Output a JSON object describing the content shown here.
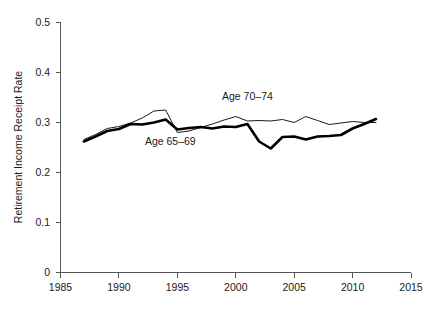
{
  "chart_data": {
    "type": "line",
    "title": "",
    "xlabel": "",
    "ylabel": "Retirement Income Receipt Rate",
    "xlim": [
      1985,
      2015
    ],
    "ylim": [
      0,
      0.5
    ],
    "xticks": [
      1985,
      1990,
      1995,
      2000,
      2005,
      2010,
      2015
    ],
    "xtick_labels": [
      "1985",
      "1990",
      "1995",
      "2000",
      "2005",
      "2010",
      "2015"
    ],
    "yticks": [
      0,
      0.1,
      0.2,
      0.3,
      0.4,
      0.5
    ],
    "ytick_labels": [
      "0",
      "0.1",
      "0.2",
      "0.3",
      "0.4",
      "0.5"
    ],
    "grid": false,
    "legend_position": "inline-annotation",
    "x": [
      1987,
      1988,
      1989,
      1990,
      1991,
      1992,
      1993,
      1994,
      1995,
      1996,
      1997,
      1998,
      1999,
      2000,
      2001,
      2002,
      2003,
      2004,
      2005,
      2006,
      2007,
      2008,
      2009,
      2010,
      2011,
      2012
    ],
    "series": [
      {
        "name": "Age 65-69",
        "label": "Age 65–69",
        "color": "#000000",
        "linewidth": 2.6,
        "values": [
          0.262,
          0.272,
          0.283,
          0.287,
          0.297,
          0.296,
          0.3,
          0.306,
          0.286,
          0.289,
          0.291,
          0.288,
          0.292,
          0.291,
          0.297,
          0.262,
          0.248,
          0.271,
          0.272,
          0.266,
          0.272,
          0.273,
          0.275,
          0.288,
          0.297,
          0.307
        ]
      },
      {
        "name": "Age 70-74",
        "label": "Age 70–74",
        "color": "#000000",
        "linewidth": 0.9,
        "values": [
          0.266,
          0.276,
          0.288,
          0.292,
          0.299,
          0.309,
          0.323,
          0.325,
          0.28,
          0.283,
          0.29,
          0.297,
          0.305,
          0.312,
          0.303,
          0.304,
          0.303,
          0.306,
          0.3,
          0.312,
          0.304,
          0.296,
          0.299,
          0.302,
          0.3,
          0.3
        ]
      }
    ],
    "annotations": [
      {
        "text": "Age 70–74",
        "x": 2001.0,
        "y": 0.345,
        "name": "label-age-70-74"
      },
      {
        "text": "Age 65–69",
        "x": 1994.4,
        "y": 0.255,
        "name": "label-age-65-69"
      }
    ]
  }
}
